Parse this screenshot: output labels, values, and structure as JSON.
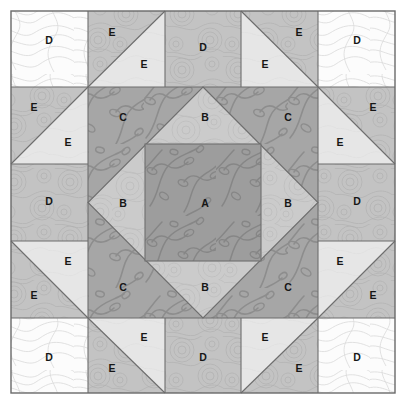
{
  "diagram": {
    "type": "quilt-block",
    "grid": {
      "rows": 5,
      "cols": 5
    },
    "block": {
      "x": 11,
      "y": 11,
      "width": 384,
      "height": 382
    },
    "background_color": "#ffffff",
    "seam_color": "#6d6d6d",
    "label_color": "#161616"
  },
  "fabrics": [
    {
      "key": "A",
      "name": "vine-print-dark",
      "color": "#9a9a9a",
      "print": "vine-leaf"
    },
    {
      "key": "B",
      "name": "swirl-print-medium",
      "color": "#c6c6c6",
      "print": "swirl"
    },
    {
      "key": "C",
      "name": "vine-print-dark",
      "color": "#a3a3a3",
      "print": "vine-leaf"
    },
    {
      "key": "D-light",
      "name": "topographic-print-white",
      "color": "#fbfbfb",
      "print": "topographic"
    },
    {
      "key": "D-medium",
      "name": "swirl-print-medium",
      "color": "#bcbcbc",
      "print": "swirl"
    },
    {
      "key": "E-light",
      "name": "solid-pale",
      "color": "#e4e4e4",
      "print": "plain"
    },
    {
      "key": "E-medium",
      "name": "swirl-print-medium",
      "color": "#bdbdbd",
      "print": "swirl"
    }
  ],
  "patches": [
    {
      "id": "corner-tl",
      "label": "D",
      "lx": 49,
      "ly": 40
    },
    {
      "id": "corner-tr",
      "label": "D",
      "lx": 357,
      "ly": 40
    },
    {
      "id": "corner-bl",
      "label": "D",
      "lx": 49,
      "ly": 357
    },
    {
      "id": "corner-br",
      "label": "D",
      "lx": 357,
      "ly": 357
    },
    {
      "id": "edge-top",
      "label": "D",
      "lx": 203,
      "ly": 47
    },
    {
      "id": "edge-left",
      "label": "D",
      "lx": 49,
      "ly": 201
    },
    {
      "id": "edge-right",
      "label": "D",
      "lx": 357,
      "ly": 201
    },
    {
      "id": "edge-bottom",
      "label": "D",
      "lx": 203,
      "ly": 357
    },
    {
      "id": "hst-top-left-dark",
      "label": "E",
      "lx": 112,
      "ly": 32
    },
    {
      "id": "hst-top-left-light",
      "label": "E",
      "lx": 144,
      "ly": 64
    },
    {
      "id": "hst-top-right-dark",
      "label": "E",
      "lx": 299,
      "ly": 32
    },
    {
      "id": "hst-top-right-light",
      "label": "E",
      "lx": 265,
      "ly": 64
    },
    {
      "id": "hst-left-top-dark",
      "label": "E",
      "lx": 34,
      "ly": 107
    },
    {
      "id": "hst-left-top-light",
      "label": "E",
      "lx": 68,
      "ly": 142
    },
    {
      "id": "hst-left-bot-dark",
      "label": "E",
      "lx": 34,
      "ly": 295
    },
    {
      "id": "hst-left-bot-light",
      "label": "E",
      "lx": 68,
      "ly": 261
    },
    {
      "id": "hst-right-top-dark",
      "label": "E",
      "lx": 373,
      "ly": 107
    },
    {
      "id": "hst-right-top-light",
      "label": "E",
      "lx": 340,
      "ly": 142
    },
    {
      "id": "hst-right-bot-dark",
      "label": "E",
      "lx": 373,
      "ly": 295
    },
    {
      "id": "hst-right-bot-light",
      "label": "E",
      "lx": 340,
      "ly": 261
    },
    {
      "id": "hst-bot-left-dark",
      "label": "E",
      "lx": 112,
      "ly": 368
    },
    {
      "id": "hst-bot-left-light",
      "label": "E",
      "lx": 144,
      "ly": 337
    },
    {
      "id": "hst-bot-right-dark",
      "label": "E",
      "lx": 299,
      "ly": 368
    },
    {
      "id": "hst-bot-right-light",
      "label": "E",
      "lx": 265,
      "ly": 337
    },
    {
      "id": "corner-triangle-c-tl",
      "label": "C",
      "lx": 123,
      "ly": 117
    },
    {
      "id": "corner-triangle-c-tr",
      "label": "C",
      "lx": 288,
      "ly": 117
    },
    {
      "id": "corner-triangle-c-bl",
      "label": "C",
      "lx": 123,
      "ly": 287
    },
    {
      "id": "corner-triangle-c-br",
      "label": "C",
      "lx": 288,
      "ly": 287
    },
    {
      "id": "diamond-b-top",
      "label": "B",
      "lx": 205,
      "ly": 117
    },
    {
      "id": "diamond-b-left",
      "label": "B",
      "lx": 123,
      "ly": 203
    },
    {
      "id": "diamond-b-right",
      "label": "B",
      "lx": 288,
      "ly": 203
    },
    {
      "id": "diamond-b-bottom",
      "label": "B",
      "lx": 205,
      "ly": 287
    },
    {
      "id": "center-square-a",
      "label": "A",
      "lx": 205,
      "ly": 203
    }
  ],
  "legend": {
    "A": "A",
    "B": "B",
    "C": "C",
    "D": "D",
    "E": "E"
  }
}
